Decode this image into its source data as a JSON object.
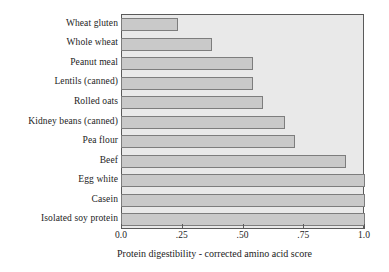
{
  "chart_data": {
    "type": "bar",
    "orientation": "horizontal",
    "title": "",
    "xlabel": "Protein digestibility - corrected amino acid score",
    "ylabel": "",
    "xlim": [
      0.0,
      1.0
    ],
    "grid": false,
    "legend": null,
    "categories": [
      "Wheat gluten",
      "Whole wheat",
      "Peanut meal",
      "Lentils (canned)",
      "Rolled oats",
      "Kidney beans (canned)",
      "Pea flour",
      "Beef",
      "Egg white",
      "Casein",
      "Isolated soy protein"
    ],
    "values": [
      0.23,
      0.37,
      0.54,
      0.54,
      0.58,
      0.67,
      0.71,
      0.92,
      1.0,
      1.0,
      1.0
    ],
    "xticks": [
      0.0,
      0.25,
      0.5,
      0.75,
      1.0
    ],
    "xticklabels": [
      "0.0",
      ".25",
      ".50",
      ".75",
      "1.0"
    ],
    "colors": {
      "bar_fill": "#c9c9c9",
      "bar_edge": "#7d7d7d",
      "plot_background": "#e9e9e9",
      "frame": "#5a5a5a",
      "text": "#1c1c1c",
      "figure_background": "#ffffff"
    }
  }
}
